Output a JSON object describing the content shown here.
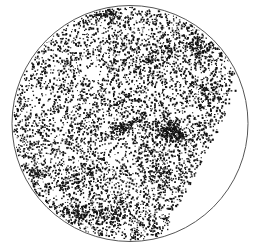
{
  "chart_data": {
    "type": "scatter",
    "title": "",
    "subtitle": "",
    "xlabel": "",
    "ylabel": "",
    "legend": [],
    "grid": false,
    "projection": "circular all-sky (polar cap) projection",
    "frame": {
      "shape": "circle",
      "center": [
        130,
        123.5
      ],
      "radius": 118,
      "stroke": "#555555",
      "stroke_width": 1
    },
    "point_style": {
      "color": "#111111",
      "size": 1.3
    },
    "background_points": {
      "count": 5200,
      "description": "roughly uniform scatter of small dots across the circular field"
    },
    "excluded_region": {
      "description": "blank lune on the right side of the disc (no data)",
      "boundary_points": [
        [
          240,
          66
        ],
        [
          232,
          95
        ],
        [
          218,
          130
        ],
        [
          200,
          165
        ],
        [
          182,
          200
        ],
        [
          165,
          230
        ],
        [
          155,
          242
        ]
      ]
    },
    "clusters": [
      {
        "name": "dense-clump-main",
        "center": [
          172,
          133
        ],
        "spread": [
          10,
          5
        ],
        "angle": 20,
        "count": 260
      },
      {
        "name": "streak-center",
        "center": [
          124,
          128
        ],
        "spread": [
          11,
          3
        ],
        "angle": -25,
        "count": 110
      },
      {
        "name": "clump-lower-left",
        "center": [
          35,
          173
        ],
        "spread": [
          5,
          4
        ],
        "angle": 0,
        "count": 60
      },
      {
        "name": "clump-bottom",
        "center": [
          80,
          215
        ],
        "spread": [
          9,
          5
        ],
        "angle": 10,
        "count": 120
      },
      {
        "name": "clump-bottom-center",
        "center": [
          112,
          212
        ],
        "spread": [
          10,
          6
        ],
        "angle": -10,
        "count": 110
      },
      {
        "name": "clump-upper-right",
        "center": [
          198,
          48
        ],
        "spread": [
          8,
          5
        ],
        "angle": 30,
        "count": 110
      },
      {
        "name": "clump-upper-right-2",
        "center": [
          205,
          95
        ],
        "spread": [
          9,
          6
        ],
        "angle": 40,
        "count": 100
      },
      {
        "name": "clump-top-center",
        "center": [
          108,
          15
        ],
        "spread": [
          9,
          4
        ],
        "angle": 0,
        "count": 70
      },
      {
        "name": "clump-upper-mid",
        "center": [
          150,
          60
        ],
        "spread": [
          12,
          6
        ],
        "angle": -20,
        "count": 90
      },
      {
        "name": "band-lower-left",
        "center": [
          80,
          175
        ],
        "spread": [
          14,
          6
        ],
        "angle": -30,
        "count": 110
      },
      {
        "name": "band-mid-right",
        "center": [
          160,
          175
        ],
        "spread": [
          12,
          7
        ],
        "angle": 50,
        "count": 110
      }
    ],
    "voids": [
      {
        "name": "void-left",
        "center": [
          40,
          100
        ],
        "radius": 14
      },
      {
        "name": "void-upper-center",
        "center": [
          95,
          70
        ],
        "radius": 12
      },
      {
        "name": "void-mid",
        "center": [
          110,
          150
        ],
        "radius": 11
      },
      {
        "name": "void-lower",
        "center": [
          60,
          195
        ],
        "radius": 9
      }
    ],
    "seed": 7
  }
}
